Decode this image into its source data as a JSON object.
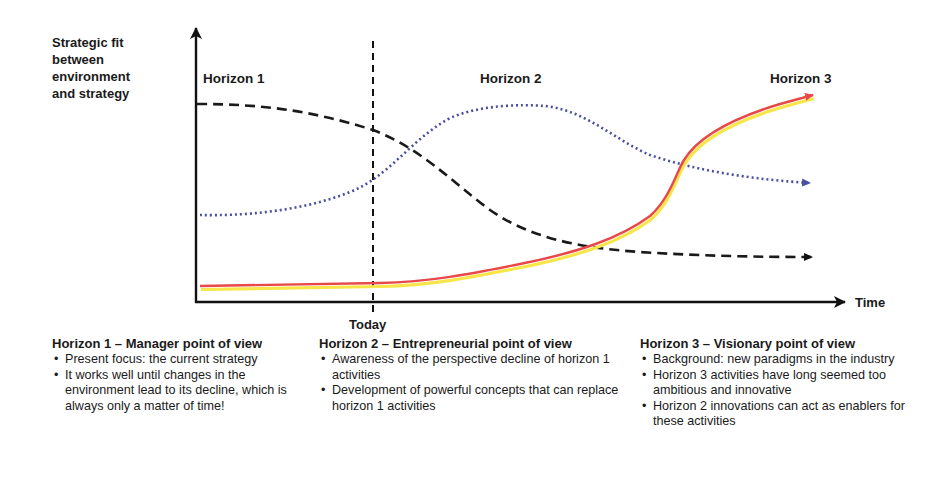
{
  "diagram": {
    "y_axis_label": "Strategic fit between environment and strategy",
    "y_axis_label_lines": [
      "Strategic fit",
      "between",
      "environment",
      "and strategy"
    ],
    "x_axis_label": "Time",
    "marker_label": "Today",
    "horizon_labels": [
      "Horizon 1",
      "Horizon 2",
      "Horizon 3"
    ],
    "colors": {
      "axis": "#111111",
      "horizon1_curve": "#1a1a1a",
      "horizon2_curve": "#4a4fa0",
      "horizon3_curve": "#e8484a",
      "horizon3_glow": "#f7e64a"
    },
    "curves": [
      {
        "name": "Horizon 1",
        "style": "dashed",
        "shape": "high plateau, declines after Today, flattens low"
      },
      {
        "name": "Horizon 2",
        "style": "dotted",
        "shape": "rises around Today, peaks mid, declines slightly"
      },
      {
        "name": "Horizon 3",
        "style": "solid",
        "shape": "low flat, rises steeply late, ends highest"
      }
    ]
  },
  "columns": [
    {
      "title": "Horizon 1 – Manager point of view",
      "bullets": [
        "Present focus: the current strategy",
        "It works well until changes in the environment lead to its decline, which is always only a matter of time!"
      ]
    },
    {
      "title": "Horizon 2 – Entrepreneurial point of view",
      "bullets": [
        "Awareness of the perspective decline of horizon 1 activities",
        "Development of powerful concepts that can replace horizon 1 activities"
      ]
    },
    {
      "title": "Horizon 3 – Visionary point of view",
      "bullets": [
        "Background: new paradigms in the industry",
        "Horizon 3 activities have long seemed too ambitious and innovative",
        "Horizon 2 innovations can act as enablers for these activities"
      ]
    }
  ]
}
